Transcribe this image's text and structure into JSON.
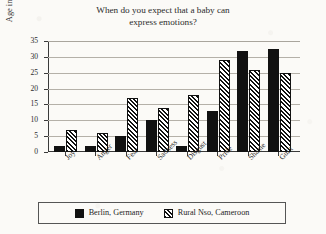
{
  "chart_data": {
    "type": "bar",
    "title": "When do you expect that a baby can express emotions?",
    "title_lines": [
      "When do you expect that a baby can",
      "express emotions?"
    ],
    "xlabel": "",
    "ylabel": "Age in months",
    "ylim": [
      0,
      35
    ],
    "ytick_step": 5,
    "yticks": [
      0,
      5,
      10,
      15,
      20,
      25,
      30,
      35
    ],
    "ytick_labels": [
      "0",
      "5",
      "10",
      "15",
      "20",
      "25",
      "30",
      "35"
    ],
    "grid": true,
    "grid_axis": "y",
    "legend_position": "bottom",
    "categories": [
      "Joy",
      "Anger",
      "Fear",
      "Sadness",
      "Disgust",
      "Pride",
      "Shame",
      "Guilt"
    ],
    "series": [
      {
        "name": "Berlin, Germany",
        "pattern": "solid",
        "color": "#111111",
        "values": [
          2,
          2,
          5,
          10,
          2,
          13,
          32,
          32.5
        ]
      },
      {
        "name": "Rural Nso, Cameroon",
        "pattern": "diagonal-hatch",
        "color": "#111111",
        "values": [
          7,
          6,
          17,
          14,
          18,
          29,
          26,
          25
        ]
      }
    ]
  },
  "legend": {
    "entries": [
      {
        "label": "Berlin, Germany",
        "pattern": "solid"
      },
      {
        "label": "Rural Nso, Cameroon",
        "pattern": "diagonal-hatch"
      }
    ]
  }
}
